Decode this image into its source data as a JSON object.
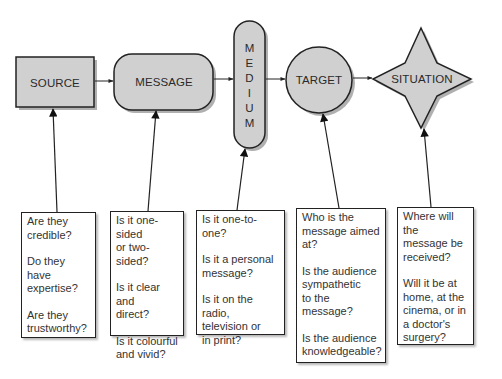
{
  "colors": {
    "shape_fill": "#d0d0d0",
    "shape_shadow": "#b0b0b0",
    "stroke": "#222222",
    "text": "#2a2a2a",
    "background": "#ffffff"
  },
  "nodes": [
    {
      "id": "source",
      "label": "SOURCE",
      "shape": "rectangle"
    },
    {
      "id": "message",
      "label": "MESSAGE",
      "shape": "rounded-rectangle"
    },
    {
      "id": "medium",
      "label": "M E D I U M",
      "letters": [
        "M",
        "E",
        "D",
        "I",
        "U",
        "M"
      ],
      "shape": "vertical-pill"
    },
    {
      "id": "target",
      "label": "TARGET",
      "shape": "circle"
    },
    {
      "id": "situation",
      "label": "SITUATION",
      "shape": "four-point-star"
    }
  ],
  "edges": [
    {
      "from": "source",
      "to": "message"
    },
    {
      "from": "message",
      "to": "medium"
    },
    {
      "from": "medium",
      "to": "target"
    },
    {
      "from": "target",
      "to": "situation"
    }
  ],
  "question_boxes": [
    {
      "for": "source",
      "questions": [
        "Are they\ncredible?",
        "Do they have\nexpertise?",
        "Are they\ntrustworthy?"
      ]
    },
    {
      "for": "message",
      "questions": [
        "Is it one-sided\nor two-sided?",
        "Is it clear and\ndirect?",
        "Is it colourful\nand vivid?"
      ]
    },
    {
      "for": "medium",
      "questions": [
        "Is it one-to-one?",
        "Is it a personal\nmessage?",
        "Is it on the radio,\ntelevision or\nin print?"
      ]
    },
    {
      "for": "target",
      "questions": [
        "Who is the\nmessage aimed\nat?",
        "Is the audience\nsympathetic\nto the message?",
        "Is the audience\nknowledgeable?"
      ]
    },
    {
      "for": "situation",
      "questions": [
        "Where will the\nmessage be\nreceived?",
        "Will it be at\nhome, at the\ncinema, or in\na doctor's\nsurgery?"
      ]
    }
  ]
}
